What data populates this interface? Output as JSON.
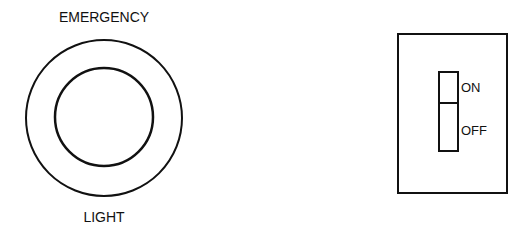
{
  "emergency_light": {
    "top_label": "EMERGENCY",
    "bottom_label": "LIGHT"
  },
  "switch_panel": {
    "on_label": "ON",
    "off_label": "OFF",
    "state": "ON"
  },
  "colors": {
    "line": "#111111",
    "background": "#ffffff"
  }
}
